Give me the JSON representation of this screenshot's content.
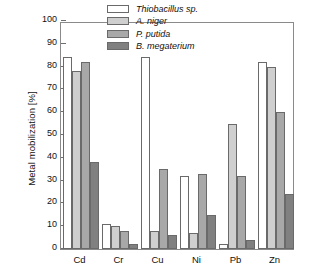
{
  "chart_data": {
    "type": "bar",
    "title": "",
    "subtitle": "",
    "xlabel": "",
    "ylabel": "Metal mobilization [%]",
    "categories": [
      "Cd",
      "Cr",
      "Cu",
      "Ni",
      "Pb",
      "Zn"
    ],
    "ylim": [
      0,
      100
    ],
    "yticks": [
      0,
      10,
      20,
      30,
      40,
      50,
      60,
      70,
      80,
      90,
      100
    ],
    "ytick_labels": [
      "0",
      "10",
      "20",
      "30",
      "40",
      "50",
      "60",
      "70",
      "80",
      "90",
      "100"
    ],
    "grid": false,
    "legend_position": "top-right",
    "series": [
      {
        "name": "Thiobacillus sp.",
        "color": "#ffffff",
        "values": [
          84,
          11,
          84,
          32,
          2,
          82
        ]
      },
      {
        "name": "A. niger",
        "color": "#cfcfcf",
        "values": [
          78,
          10,
          8,
          7,
          55,
          80
        ]
      },
      {
        "name": "P. putida",
        "color": "#a8a8a8",
        "values": [
          82,
          8,
          35,
          33,
          32,
          60
        ]
      },
      {
        "name": "B. megaterium",
        "color": "#808080",
        "values": [
          38,
          2,
          6,
          15,
          4,
          24
        ]
      }
    ]
  },
  "axes": {
    "frame_color": "#8a8a8a",
    "tick_color": "#6e6e6e",
    "bar_edge_color": "#6a6a6a"
  }
}
